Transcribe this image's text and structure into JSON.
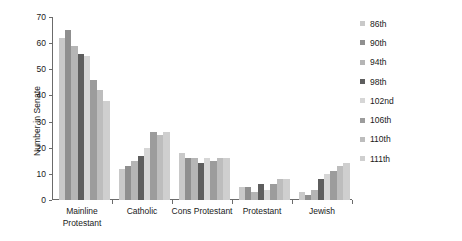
{
  "chart_data": {
    "type": "bar",
    "title": "",
    "xlabel": "",
    "ylabel": "Number in Senate",
    "ylim": [
      0,
      70
    ],
    "yticks": [
      0,
      10,
      20,
      30,
      40,
      50,
      60,
      70
    ],
    "grid": false,
    "legend_position": "right",
    "categories": [
      "Mainline Protestant",
      "Catholic",
      "Cons Protestant",
      "Protestant",
      "Jewish"
    ],
    "category_lines": [
      [
        "Mainline",
        "Protestant"
      ],
      [
        "Catholic"
      ],
      [
        "Cons Protestant"
      ],
      [
        "Protestant"
      ],
      [
        "Jewish"
      ]
    ],
    "series": [
      {
        "name": "86th",
        "color": "#c9c9c9",
        "values": [
          62,
          12,
          18,
          5,
          3
        ]
      },
      {
        "name": "90th",
        "color": "#8f8f8f",
        "values": [
          65,
          13,
          16,
          5,
          2
        ]
      },
      {
        "name": "94th",
        "color": "#b5b5b5",
        "values": [
          59,
          15,
          16,
          3,
          4
        ]
      },
      {
        "name": "98th",
        "color": "#5e5e5e",
        "values": [
          56,
          17,
          14,
          6,
          8
        ]
      },
      {
        "name": "102nd",
        "color": "#d6d6d6",
        "values": [
          55,
          20,
          16,
          4,
          10
        ]
      },
      {
        "name": "106th",
        "color": "#9c9c9c",
        "values": [
          46,
          26,
          15,
          6,
          11
        ]
      },
      {
        "name": "110th",
        "color": "#bdbdbd",
        "values": [
          42,
          25,
          16,
          8,
          13
        ]
      },
      {
        "name": "111th",
        "color": "#cfcfcf",
        "values": [
          38,
          26,
          16,
          8,
          14
        ]
      }
    ]
  },
  "legend": {
    "items": [
      {
        "label": "86th"
      },
      {
        "label": "90th"
      },
      {
        "label": "94th"
      },
      {
        "label": "98th"
      },
      {
        "label": "102nd"
      },
      {
        "label": "106th"
      },
      {
        "label": "110th"
      },
      {
        "label": "111th"
      }
    ]
  },
  "axis": {
    "y_title": "Number in Senate"
  }
}
